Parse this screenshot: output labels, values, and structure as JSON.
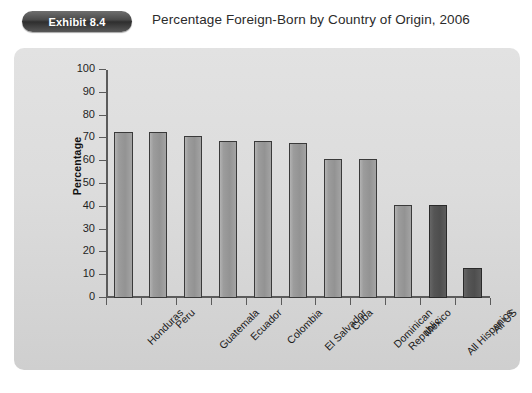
{
  "header": {
    "badge_label": "Exhibit 8.4",
    "title": "Percentage Foreign-Born by Country of Origin, 2006"
  },
  "colors": {
    "bar_light": "#9c9c9c",
    "bar_dark": "#525252",
    "bar_outline": "#3a3a3a",
    "panel_background": "#dcdcdc",
    "badge_background": "#3d3d3d",
    "axis": "#5b5b5b",
    "text": "#1b1b1b"
  },
  "chart_data": {
    "type": "bar",
    "title": "Percentage Foreign-Born by Country of Origin, 2006",
    "xlabel": "",
    "ylabel": "Percentage",
    "ylim": [
      0,
      100
    ],
    "ytick_step": 10,
    "yticks": [
      100,
      90,
      80,
      70,
      60,
      50,
      40,
      30,
      20,
      10,
      0
    ],
    "grid": false,
    "legend": "none",
    "categories": [
      "Honduras",
      "Peru",
      "Guatemala",
      "Ecuador",
      "Colombia",
      "El Salvador",
      "Cuba",
      "Dominican Republic",
      "Mexico",
      "All Hispanics",
      "All US"
    ],
    "category_lines": [
      [
        "Honduras"
      ],
      [
        "Peru"
      ],
      [
        "Guatemala"
      ],
      [
        "Ecuador"
      ],
      [
        "Colombia"
      ],
      [
        "El Salvador"
      ],
      [
        "Cuba"
      ],
      [
        "Dominican",
        "Republic"
      ],
      [
        "Mexico"
      ],
      [
        "All Hispanics"
      ],
      [
        "All US"
      ]
    ],
    "values": [
      73,
      73,
      71,
      69,
      69,
      68,
      61,
      61,
      41,
      41,
      13
    ],
    "bar_styles": [
      "light",
      "light",
      "light",
      "light",
      "light",
      "light",
      "light",
      "light",
      "light",
      "dark",
      "dark"
    ]
  }
}
